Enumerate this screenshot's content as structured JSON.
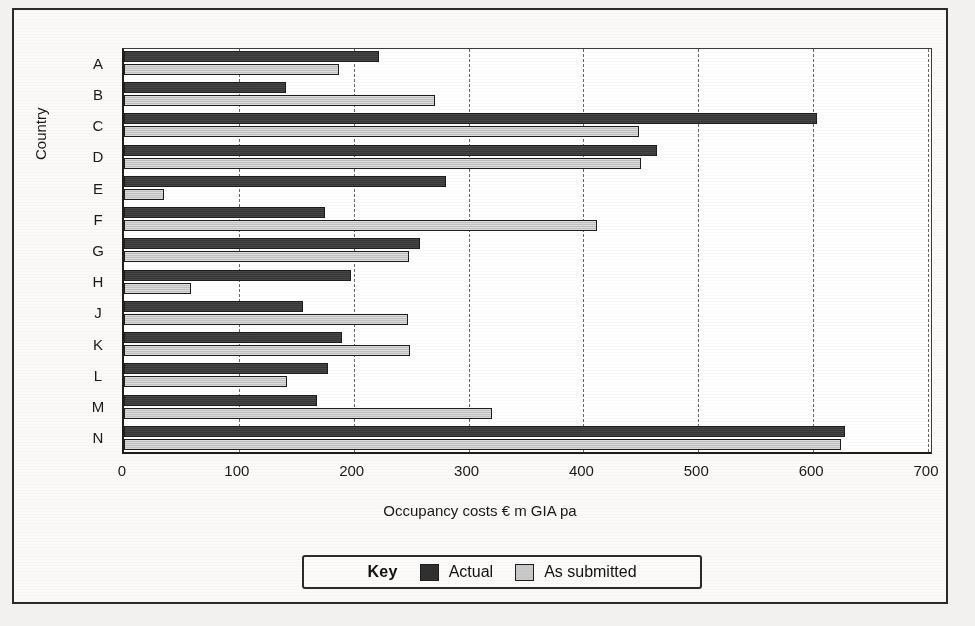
{
  "chart_data": {
    "type": "bar",
    "orientation": "horizontal",
    "title": "",
    "xlabel": "Occupancy costs € m GIA pa",
    "ylabel": "Country",
    "categories": [
      "A",
      "B",
      "C",
      "D",
      "E",
      "F",
      "G",
      "H",
      "J",
      "K",
      "L",
      "M",
      "N"
    ],
    "series": [
      {
        "name": "Actual",
        "color": "#3a3a3a",
        "values": [
          222,
          141,
          603,
          464,
          280,
          175,
          258,
          198,
          156,
          190,
          178,
          168,
          628
        ]
      },
      {
        "name": "As submitted",
        "color": "#c9c9c9",
        "values": [
          187,
          271,
          448,
          450,
          35,
          412,
          248,
          58,
          247,
          249,
          142,
          320,
          624
        ]
      }
    ],
    "xlim": [
      0,
      700
    ],
    "xticks": [
      0,
      100,
      200,
      300,
      400,
      500,
      600,
      700
    ],
    "xtick_labels": [
      "0",
      "100",
      "200",
      "300",
      "400",
      "500",
      "600",
      "700"
    ],
    "grid": "vertical-dashed",
    "legend_position": "bottom-center"
  },
  "legend": {
    "title": "Key",
    "items": [
      {
        "label": "Actual",
        "swatch": "dark-swatch-icon"
      },
      {
        "label": "As submitted",
        "swatch": "light-swatch-icon"
      }
    ]
  },
  "colors": {
    "actual": "#3a3a3a",
    "as_submitted": "#c9c9c9",
    "axis": "#1e1e1e",
    "grid": "#6a6a6a",
    "paper": "#f2f1ef"
  }
}
